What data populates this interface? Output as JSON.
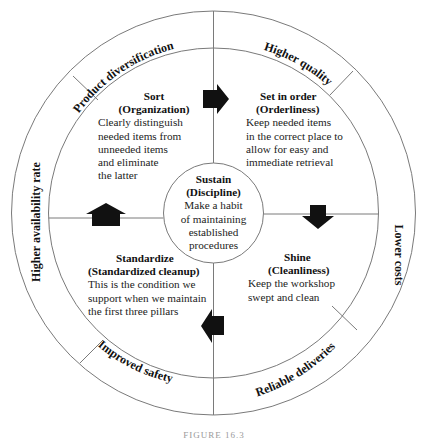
{
  "outer_ring": {
    "labels": [
      {
        "id": "product-diversification",
        "text": "Product diversification"
      },
      {
        "id": "higher-quality",
        "text": "Higher quality"
      },
      {
        "id": "lower-costs",
        "text": "Lower costs"
      },
      {
        "id": "reliable-deliveries",
        "text": "Reliable deliveries"
      },
      {
        "id": "improved-safety",
        "text": "Improved safety"
      },
      {
        "id": "higher-availability-rate",
        "text": "Higher availability rate"
      }
    ]
  },
  "quadrants": {
    "sort": {
      "title": "Sort",
      "subtitle": "(Organization)",
      "lines": [
        "Clearly distinguish",
        "needed items from",
        "unneeded items",
        "and eliminate",
        "the latter"
      ]
    },
    "set_in_order": {
      "title": "Set in order",
      "subtitle": "(Orderliness)",
      "lines": [
        "Keep needed items",
        "in the correct place to",
        "allow for easy and",
        "immediate retrieval"
      ]
    },
    "shine": {
      "title": "Shine",
      "subtitle": "(Cleanliness)",
      "lines": [
        "Keep the workshop",
        "swept and clean"
      ]
    },
    "standardize": {
      "title": "Standardize",
      "subtitle": "(Standardized cleanup)",
      "lines": [
        "This is the condition we",
        "support when we maintain",
        "the first three pillars"
      ]
    }
  },
  "center": {
    "title": "Sustain",
    "subtitle": "(Discipline)",
    "lines": [
      "Make a habit",
      "of maintaining",
      "established",
      "procedures"
    ]
  },
  "arrows": [
    {
      "id": "sort-to-set-in-order",
      "direction": "right"
    },
    {
      "id": "set-in-order-to-shine",
      "direction": "down"
    },
    {
      "id": "shine-to-standardize",
      "direction": "left"
    },
    {
      "id": "standardize-to-sort",
      "direction": "up"
    }
  ],
  "colors": {
    "line": "#6e6e6e",
    "arrow": "#111111",
    "text": "#1a1a1a"
  },
  "caption": {
    "text": "FIGURE 16.3"
  }
}
